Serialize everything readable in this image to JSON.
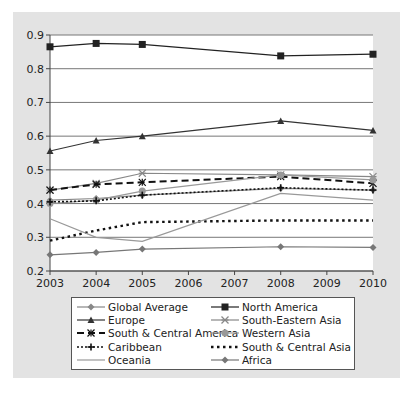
{
  "chart_data": {
    "type": "line",
    "title": "",
    "xlabel": "",
    "ylabel": "",
    "x": [
      2003,
      2004,
      2005,
      2008,
      2010
    ],
    "x_ticks": [
      "2003",
      "2004",
      "2005",
      "2006",
      "2007",
      "2008",
      "2009",
      "2010"
    ],
    "xlim": [
      2003,
      2010
    ],
    "y_ticks": [
      "0.2",
      "0.3",
      "0.4",
      "0.5",
      "0.6",
      "0.7",
      "0.8",
      "0.9"
    ],
    "ylim": [
      0.2,
      0.9
    ],
    "grid": true,
    "legend_position": "bottom",
    "series": [
      {
        "name": "Global Average",
        "values": [
          0.41,
          0.415,
          0.425,
          0.445,
          0.44
        ],
        "color": "#888888",
        "dash": "solid",
        "marker": "diamond"
      },
      {
        "name": "North America",
        "values": [
          0.865,
          0.875,
          0.872,
          0.838,
          0.843
        ],
        "color": "#222222",
        "dash": "solid",
        "marker": "square"
      },
      {
        "name": "Europe",
        "values": [
          0.556,
          0.587,
          0.6,
          0.645,
          0.617
        ],
        "color": "#333333",
        "dash": "solid",
        "marker": "triangle"
      },
      {
        "name": "South-Eastern Asia",
        "values": [
          0.44,
          0.46,
          0.49,
          0.485,
          0.48
        ],
        "color": "#888888",
        "dash": "solid",
        "marker": "star"
      },
      {
        "name": "South & Central America",
        "values": [
          0.44,
          0.457,
          0.463,
          0.48,
          0.46
        ],
        "color": "#111111",
        "dash": "dashed",
        "marker": "asterisk"
      },
      {
        "name": "Western Asia",
        "values": [
          0.4,
          0.41,
          0.437,
          0.485,
          0.47
        ],
        "color": "#999999",
        "dash": "solid",
        "marker": "circle"
      },
      {
        "name": "Caribbean",
        "values": [
          0.405,
          0.408,
          0.425,
          0.447,
          0.44
        ],
        "color": "#111111",
        "dash": "dotted",
        "marker": "plus"
      },
      {
        "name": "South & Central Asia",
        "values": [
          0.29,
          0.32,
          0.345,
          0.35,
          0.35
        ],
        "color": "#111111",
        "dash": "dotted-heavy",
        "marker": "none"
      },
      {
        "name": "Oceania",
        "values": [
          0.355,
          0.3,
          0.288,
          0.43,
          0.41
        ],
        "color": "#999999",
        "dash": "solid",
        "marker": "none"
      },
      {
        "name": "Africa",
        "values": [
          0.248,
          0.255,
          0.265,
          0.272,
          0.27
        ],
        "color": "#777777",
        "dash": "solid",
        "marker": "diamond"
      }
    ]
  }
}
